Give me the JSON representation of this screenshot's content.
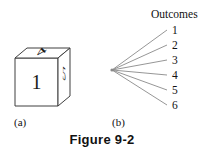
{
  "figure": {
    "caption": "Figure 9-2",
    "panels": [
      {
        "key": "a",
        "label": "(a)"
      },
      {
        "key": "b",
        "label": "(b)"
      }
    ]
  },
  "die": {
    "front_face_value": "1",
    "top_face_value": "4",
    "right_face_value": "5",
    "outline_color": "#3f3f3f",
    "digit_color": "#1a1a1a",
    "fill_color": "#ffffff"
  },
  "tree": {
    "title": "Outcomes",
    "branch_color": "#8a8a8a",
    "label_color": "#111111",
    "outcomes": [
      {
        "value": "1"
      },
      {
        "value": "2"
      },
      {
        "value": "3"
      },
      {
        "value": "4"
      },
      {
        "value": "5"
      },
      {
        "value": "6"
      }
    ]
  }
}
